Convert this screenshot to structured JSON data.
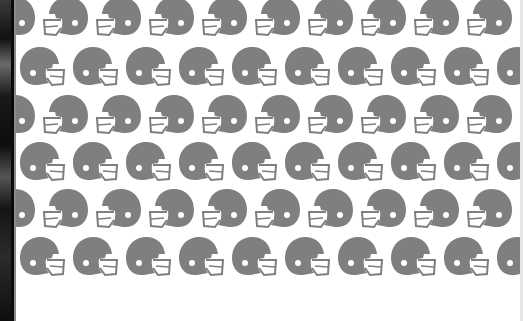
{
  "image": {
    "description": "Repeating pattern of gray football helmets on white background with a dark photo strip on the left edge",
    "background_color": "#ffffff",
    "helmet_color": "#7f7f7f",
    "strip_color": "#0a0a0a"
  },
  "pattern": {
    "icon": "football-helmet-icon",
    "rows": [
      {
        "top": -4,
        "offset": 26,
        "facing": "left"
      },
      {
        "top": 46,
        "offset": 0,
        "facing": "right"
      },
      {
        "top": 94,
        "offset": 26,
        "facing": "left"
      },
      {
        "top": 141,
        "offset": 0,
        "facing": "right"
      },
      {
        "top": 188,
        "offset": 26,
        "facing": "left"
      },
      {
        "top": 236,
        "offset": 0,
        "facing": "right"
      }
    ],
    "column_spacing": 53,
    "columns": 11
  }
}
